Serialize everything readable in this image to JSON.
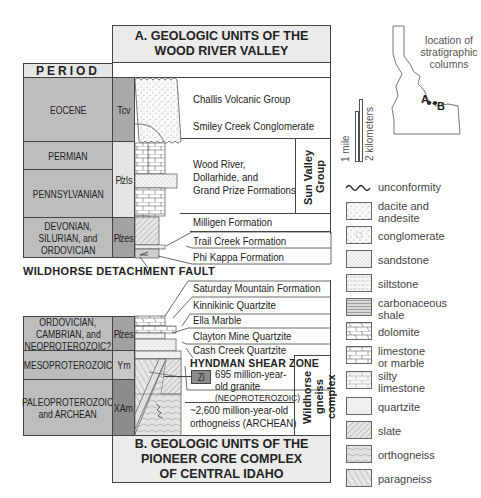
{
  "figure": {
    "title_a_line1": "A. GEOLOGIC UNITS OF THE",
    "title_a_line2": "WOOD RIVER VALLEY",
    "title_b_line1": "B. GEOLOGIC UNITS OF THE",
    "title_b_line2": "PIONEER CORE COMPLEX",
    "title_b_line3": "OF CENTRAL IDAHO",
    "period_header": "PERIOD",
    "fault_label": "WILDHORSE DETACHMENT FAULT"
  },
  "column_a": {
    "periods": [
      {
        "name": "EOCENE",
        "symbol": "Tcv"
      },
      {
        "name": "PERMIAN",
        "symbol": ""
      },
      {
        "name": "PENNSYLVANIAN",
        "symbol": "Pₗls"
      },
      {
        "name_line1": "DEVONIAN,",
        "name_line2": "SILURIAN, and",
        "name_line3": "ORDOVICIAN",
        "symbol": "Pₗes"
      }
    ],
    "symbol_pzls": "P̸zls",
    "symbol_pzes": "P̸zes",
    "units": [
      "Challis Volcanic Group",
      "Smiley Creek Conglomerate",
      "Wood River,",
      "Dollarhide, and",
      "Grand Prize Formations",
      "Milligen Formation",
      "Trail Creek Formation",
      "Phi Kappa Formation"
    ],
    "group_label_line1": "Sun Valley",
    "group_label_line2": "Group"
  },
  "column_b": {
    "periods": [
      {
        "name_line1": "ORDOVICIAN,",
        "name_line2": "CAMBRIAN, and",
        "name_line3": "NEOPROTEROZOIC?",
        "symbol": "P̸zes"
      },
      {
        "name": "MESOPROTEROZOIC",
        "symbol": "Ym"
      },
      {
        "name_line1": "PALEOPROTEROZOIC",
        "name_line2": "and ARCHEAN",
        "symbol": "XAm"
      }
    ],
    "units": [
      "Saturday Mountain Formation",
      "Kinnikinic Quartzite",
      "Ella Marble",
      "Clayton Mine Quartzite",
      "Cash Creek Quartzite"
    ],
    "shear_zone": "HYNDMAN SHEAR ZONE",
    "zi_symbol": "Zi",
    "granite_line1": "695 million-year-",
    "granite_line2": "old granite",
    "granite_line3": "(NEOPROTEROZOIC)",
    "orthogneiss_line1": "~2,600 million-year-old",
    "orthogneiss_line2": "orthogneiss (ARCHEAN)",
    "complex_line1": "Wildhorse",
    "complex_line2": "gneiss complex"
  },
  "map": {
    "caption_line1": "location of",
    "caption_line2": "stratigraphic",
    "caption_line3": "columns",
    "point_a": "A",
    "point_b": "B"
  },
  "scale": {
    "mile": "1 mile",
    "km": "2 kilometers"
  },
  "legend": {
    "unconformity": "unconformity",
    "items": [
      {
        "label_line1": "dacite and",
        "label_line2": "andesite",
        "pattern": "dacite"
      },
      {
        "label_line1": "conglomerate",
        "label_line2": "",
        "pattern": "conglomerate"
      },
      {
        "label_line1": "sandstone",
        "label_line2": "",
        "pattern": "sandstone"
      },
      {
        "label_line1": "siltstone",
        "label_line2": "",
        "pattern": "siltstone"
      },
      {
        "label_line1": "carbonaceous",
        "label_line2": "shale",
        "pattern": "shale"
      },
      {
        "label_line1": "dolomite",
        "label_line2": "",
        "pattern": "dolomite"
      },
      {
        "label_line1": "limestone",
        "label_line2": "or marble",
        "pattern": "limestone"
      },
      {
        "label_line1": "silty",
        "label_line2": "limestone",
        "pattern": "silty-limestone"
      },
      {
        "label_line1": "quartzite",
        "label_line2": "",
        "pattern": "quartzite"
      },
      {
        "label_line1": "slate",
        "label_line2": "",
        "pattern": "slate"
      },
      {
        "label_line1": "orthogneiss",
        "label_line2": "",
        "pattern": "orthogneiss"
      },
      {
        "label_line1": "paragneiss",
        "label_line2": "",
        "pattern": "paragneiss"
      }
    ]
  },
  "colors": {
    "period_fill": "#bdbdbd",
    "title_fill": "#ebebeb",
    "symbol_dark": "#8c8c8c",
    "symbol_mid": "#a8a8a8",
    "line": "#444444"
  }
}
